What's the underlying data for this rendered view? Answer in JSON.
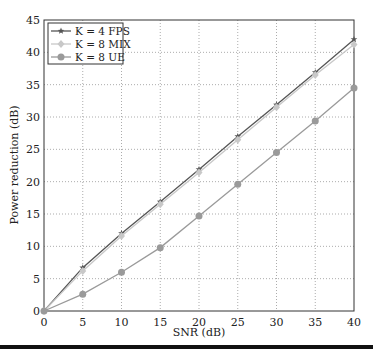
{
  "chart_data": {
    "type": "line",
    "title": "",
    "xlabel": "SNR (dB)",
    "ylabel": "Power reduction (dB)",
    "xlim": [
      0,
      40
    ],
    "ylim": [
      0,
      45
    ],
    "xticks": [
      0,
      5,
      10,
      15,
      20,
      25,
      30,
      35,
      40
    ],
    "yticks": [
      0,
      5,
      10,
      15,
      20,
      25,
      30,
      35,
      40,
      45
    ],
    "grid": true,
    "legend_position": "upper left",
    "x": [
      0,
      5,
      10,
      15,
      20,
      25,
      30,
      35,
      40
    ],
    "series": [
      {
        "name": "K = 4 FPS",
        "marker": "star",
        "color": "#555555",
        "values": [
          0,
          6.7,
          12.0,
          16.9,
          21.9,
          27.0,
          31.9,
          36.9,
          42.0
        ]
      },
      {
        "name": "K = 8 MIX",
        "marker": "diamond",
        "color": "#c8c8c8",
        "values": [
          0,
          6.2,
          11.6,
          16.5,
          21.4,
          26.5,
          31.5,
          36.5,
          41.2
        ]
      },
      {
        "name": "K = 8 UE",
        "marker": "circle",
        "color": "#9a9a9a",
        "values": [
          0,
          2.6,
          6.0,
          9.8,
          14.7,
          19.6,
          24.5,
          29.4,
          34.5
        ]
      }
    ]
  }
}
